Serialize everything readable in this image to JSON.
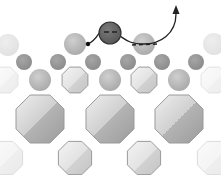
{
  "diagram": {
    "title": "",
    "colors": {
      "background": "#ffffff",
      "adatom_fill": "#6e6e6e",
      "adatom_stroke": "#333333",
      "surface_atom_light": "#bdbdbd",
      "small_atom": "#9a9a9a",
      "octagon_light": "#e6e6e6",
      "octagon_dark": "#a8a8a8",
      "path_stroke": "#222222"
    },
    "adatom": {
      "cx": 110,
      "cy": 33,
      "r": 11,
      "charge": "negative"
    },
    "top_atoms": [
      {
        "cx": 8,
        "cy": 45,
        "r": 11,
        "opacity": 0.35
      },
      {
        "cx": 75,
        "cy": 44,
        "r": 11,
        "opacity": 1
      },
      {
        "cx": 144,
        "cy": 44,
        "r": 11,
        "opacity": 1
      },
      {
        "cx": 214,
        "cy": 44,
        "r": 11,
        "opacity": 0.35
      }
    ],
    "small_atoms": [
      {
        "cx": 24,
        "cy": 62,
        "r": 8
      },
      {
        "cx": 58,
        "cy": 62,
        "r": 8
      },
      {
        "cx": 93,
        "cy": 62,
        "r": 8
      },
      {
        "cx": 128,
        "cy": 62,
        "r": 8
      },
      {
        "cx": 162,
        "cy": 62,
        "r": 8
      },
      {
        "cx": 196,
        "cy": 62,
        "r": 8
      }
    ],
    "mid_atoms": [
      {
        "cx": 40,
        "cy": 80,
        "r": 11
      },
      {
        "cx": 110,
        "cy": 80,
        "r": 11
      },
      {
        "cx": 179,
        "cy": 80,
        "r": 11
      }
    ],
    "small_octagons": [
      {
        "cx": 5,
        "cy": 80,
        "r": 14,
        "opacity": 0.3
      },
      {
        "cx": 75,
        "cy": 80,
        "r": 14,
        "opacity": 1
      },
      {
        "cx": 144,
        "cy": 80,
        "r": 14,
        "opacity": 1
      },
      {
        "cx": 214,
        "cy": 80,
        "r": 14,
        "opacity": 0.3
      }
    ],
    "large_octagons": [
      {
        "cx": 40,
        "cy": 119,
        "r": 26
      },
      {
        "cx": 110,
        "cy": 119,
        "r": 26
      },
      {
        "cx": 179,
        "cy": 119,
        "r": 26
      }
    ],
    "bottom_octagons": [
      {
        "cx": 6,
        "cy": 158,
        "r": 18,
        "opacity": 0.35
      },
      {
        "cx": 75,
        "cy": 158,
        "r": 18,
        "opacity": 1
      },
      {
        "cx": 144,
        "cy": 158,
        "r": 18,
        "opacity": 1
      },
      {
        "cx": 214,
        "cy": 158,
        "r": 18,
        "opacity": 0.35
      }
    ],
    "hop_path": "M 88 44 C 96 40, 98 34, 100 32 M 120 36 C 126 40, 130 44, 144 44 C 160 44, 176 34, 176 14",
    "dashed_path": "M 132 45 L 158 44",
    "arrow_tip": {
      "x": 176,
      "y": 8
    }
  }
}
